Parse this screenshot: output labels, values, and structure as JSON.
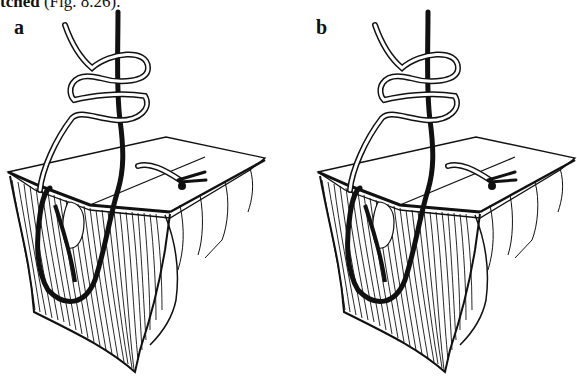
{
  "caption": {
    "bold_fragment": "tched",
    "regular_fragment": " (Fig. 8.26)."
  },
  "figure": {
    "panels": [
      {
        "label": "a"
      },
      {
        "label": "b"
      }
    ],
    "colors": {
      "ink": "#111111",
      "paper": "#ffffff"
    }
  }
}
